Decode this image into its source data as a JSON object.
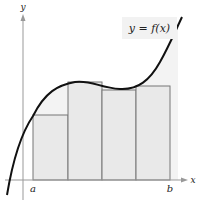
{
  "figure": {
    "function_label": "y = f(x)",
    "axis_labels": {
      "x": "x",
      "y": "y"
    },
    "interval_labels": {
      "a": "a",
      "b": "b"
    },
    "colors": {
      "curve": "#111111",
      "rect_fill": "#e9e9e9",
      "rect_stroke": "#777777",
      "label_bg": "#f2f2f2",
      "axis": "#999999"
    },
    "rectangles": [
      {
        "x0": 33,
        "x1": 68,
        "top": 115
      },
      {
        "x0": 68,
        "x1": 102,
        "top": 82
      },
      {
        "x0": 102,
        "x1": 136,
        "top": 90
      },
      {
        "x0": 136,
        "x1": 170,
        "top": 86
      }
    ]
  }
}
